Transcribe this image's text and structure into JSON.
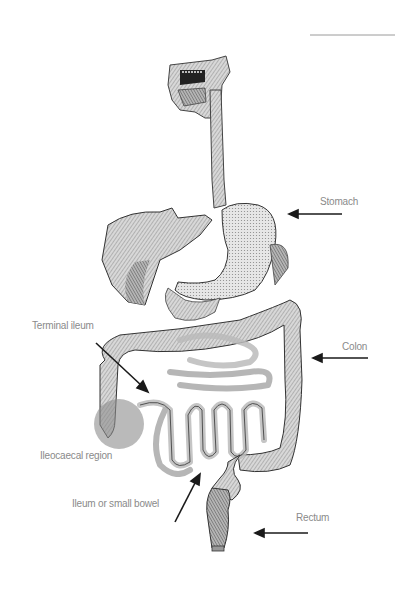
{
  "diagram": {
    "type": "anatomical illustration",
    "labels": [
      {
        "id": "stomach",
        "text": "Stomach",
        "x": 320,
        "y": 196,
        "arrow_from": [
          342,
          214
        ],
        "arrow_to": [
          290,
          214
        ]
      },
      {
        "id": "terminal_ileum",
        "text": "Terminal ileum",
        "x": 32,
        "y": 320,
        "arrow_from": [
          96,
          343
        ],
        "arrow_to": [
          147,
          390
        ]
      },
      {
        "id": "colon",
        "text": "Colon",
        "x": 342,
        "y": 341,
        "arrow_from": [
          368,
          358
        ],
        "arrow_to": [
          314,
          358
        ]
      },
      {
        "id": "ileocaecal_region",
        "text": "Ileocaecal region",
        "x": 40,
        "y": 450,
        "highlight_circle": {
          "cx": 119,
          "cy": 424,
          "r": 25,
          "color": "#8c8c8c"
        }
      },
      {
        "id": "ileum_small_bowel",
        "text": "Ileum or small bowel",
        "x": 72,
        "y": 498,
        "arrow_from": [
          175,
          522
        ],
        "arrow_to": [
          199,
          475
        ]
      },
      {
        "id": "rectum",
        "text": "Rectum",
        "x": 296,
        "y": 512,
        "arrow_from": [
          308,
          533
        ],
        "arrow_to": [
          256,
          533
        ]
      }
    ],
    "colors": {
      "label_text": "#8a8a8a",
      "arrow": "#1a1a1a",
      "illustration": "#555555",
      "highlight": "#8c8c8c"
    }
  }
}
